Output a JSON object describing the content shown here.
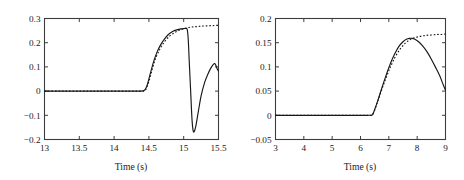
{
  "figure": {
    "background": "#ffffff",
    "line_color": "#181818",
    "axis_color": "#3d3d3d",
    "panel_count": 2
  },
  "chart_data": [
    {
      "type": "line",
      "panel": "left",
      "title": "",
      "xlabel": "Time (s)",
      "ylabel": "",
      "xlim": [
        13,
        15.5
      ],
      "ylim": [
        -0.2,
        0.3
      ],
      "xticks": [
        13,
        13.5,
        14,
        14.5,
        15,
        15.5
      ],
      "xticklabels": [
        "13",
        "13.5",
        "14",
        "14.5",
        "15",
        "15.5"
      ],
      "yticks": [
        -0.2,
        -0.1,
        0,
        0.1,
        0.2,
        0.3
      ],
      "yticklabels": [
        "-0.2",
        "-0.1",
        "0",
        "0.1",
        "0.2",
        "0.3"
      ],
      "grid": false,
      "legend": null,
      "series": [
        {
          "name": "measured",
          "style": "solid",
          "x": [
            13.0,
            13.2,
            13.4,
            13.6,
            13.8,
            14.0,
            14.2,
            14.35,
            14.43,
            14.47,
            14.52,
            14.57,
            14.62,
            14.67,
            14.72,
            14.78,
            14.84,
            14.9,
            14.96,
            15.0,
            15.03,
            15.05,
            15.065,
            15.08,
            15.1,
            15.12,
            15.14,
            15.17,
            15.21,
            15.25,
            15.3,
            15.35,
            15.4,
            15.44,
            15.46,
            15.48,
            15.5
          ],
          "y": [
            0.0,
            0.0,
            0.0,
            0.0,
            0.0,
            0.0,
            0.0,
            0.0,
            0.002,
            0.02,
            0.072,
            0.124,
            0.163,
            0.192,
            0.214,
            0.234,
            0.246,
            0.253,
            0.257,
            0.258,
            0.259,
            0.255,
            0.215,
            0.12,
            0.0,
            -0.12,
            -0.168,
            -0.15,
            -0.085,
            -0.02,
            0.035,
            0.072,
            0.1,
            0.114,
            0.108,
            0.092,
            0.083
          ]
        },
        {
          "name": "model",
          "style": "dashed",
          "x": [
            13.0,
            13.3,
            13.6,
            13.9,
            14.2,
            14.4,
            14.45,
            14.5,
            14.55,
            14.6,
            14.66,
            14.72,
            14.8,
            14.88,
            14.96,
            15.04,
            15.12,
            15.2,
            15.28,
            15.36,
            15.44,
            15.5
          ],
          "y": [
            0.0,
            0.0,
            0.0,
            0.0,
            0.0,
            0.0,
            0.004,
            0.04,
            0.093,
            0.138,
            0.175,
            0.202,
            0.228,
            0.243,
            0.254,
            0.261,
            0.265,
            0.267,
            0.269,
            0.27,
            0.271,
            0.272
          ]
        }
      ]
    },
    {
      "type": "line",
      "panel": "right",
      "title": "",
      "xlabel": "Time (s)",
      "ylabel": "",
      "xlim": [
        3,
        9
      ],
      "ylim": [
        -0.05,
        0.2
      ],
      "xticks": [
        3,
        4,
        5,
        6,
        7,
        8,
        9
      ],
      "xticklabels": [
        "3",
        "4",
        "5",
        "6",
        "7",
        "8",
        "9"
      ],
      "yticks": [
        -0.05,
        0,
        0.05,
        0.1,
        0.15,
        0.2
      ],
      "yticklabels": [
        "-0.05",
        "0",
        "0.05",
        "0.1",
        "0.15",
        "0.2"
      ],
      "grid": false,
      "legend": null,
      "series": [
        {
          "name": "measured",
          "style": "solid",
          "x": [
            3.0,
            3.5,
            4.0,
            4.5,
            5.0,
            5.5,
            6.0,
            6.3,
            6.42,
            6.5,
            6.62,
            6.75,
            6.9,
            7.05,
            7.2,
            7.35,
            7.5,
            7.62,
            7.72,
            7.82,
            7.92,
            8.05,
            8.2,
            8.35,
            8.5,
            8.65,
            8.8,
            8.92,
            9.0
          ],
          "y": [
            0.0,
            0.0,
            0.0,
            0.0,
            0.0,
            0.0,
            0.0,
            0.0,
            0.001,
            0.012,
            0.032,
            0.056,
            0.082,
            0.106,
            0.126,
            0.142,
            0.152,
            0.157,
            0.159,
            0.159,
            0.157,
            0.152,
            0.143,
            0.131,
            0.116,
            0.099,
            0.081,
            0.063,
            0.052
          ]
        },
        {
          "name": "model",
          "style": "dashed",
          "x": [
            3.0,
            3.6,
            4.2,
            4.8,
            5.4,
            6.0,
            6.35,
            6.45,
            6.58,
            6.72,
            6.88,
            7.05,
            7.22,
            7.4,
            7.58,
            7.74,
            7.9,
            8.1,
            8.3,
            8.5,
            8.7,
            8.85,
            9.0
          ],
          "y": [
            0.0,
            0.0,
            0.0,
            0.0,
            0.0,
            0.0,
            0.0,
            0.004,
            0.024,
            0.048,
            0.074,
            0.099,
            0.12,
            0.137,
            0.149,
            0.156,
            0.16,
            0.163,
            0.165,
            0.166,
            0.167,
            0.167,
            0.168
          ]
        }
      ]
    }
  ]
}
